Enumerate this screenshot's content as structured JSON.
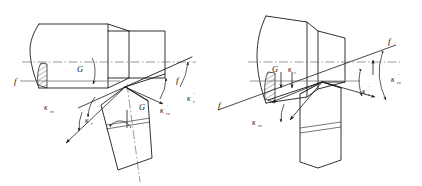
{
  "figure": {
    "background_color": "#ffffff",
    "line_color": "#1a1a1a",
    "centerline_color": "#555555",
    "width": 422,
    "height": 186
  },
  "left_diagram": {
    "name": "offset-turning-tool-configuration",
    "workpiece": "stepped cylindrical shaft with section hatching",
    "tool": "inclined single-point turning tool with chip breaker",
    "labels": {
      "feed_left": "f",
      "feed_right": "f",
      "rotation_workpiece": "G",
      "rotation_tool": "G",
      "kappa_r_eps": "κ",
      "kappa_r_eps_sub": "rε",
      "kappa_r": "κ",
      "kappa_r_sub": "r",
      "kappa_r_prime": "κ",
      "kappa_r_prime_sub": "r",
      "kappa_r_prime_mark": "′",
      "kappa_r_eps_prime": "κ",
      "kappa_r_eps_prime_sub": "rε",
      "kappa_r_eps_prime_mark": "′"
    }
  },
  "right_diagram": {
    "name": "vertical-turning-tool-configuration",
    "workpiece": "tapered conical shaft with section hatching",
    "tool": "vertical single-point turning tool with chip breaker",
    "labels": {
      "feed_left": "f",
      "feed_right": "f",
      "rotation_workpiece": "G",
      "kappa_r": "κ",
      "kappa_r_sub": "r",
      "kappa_r_eps": "κ",
      "kappa_r_eps_sub": "rε",
      "kappa_r_prime": "κ",
      "kappa_r_prime_sub": "r",
      "kappa_r_prime_mark": "′",
      "kappa_r_eps_prime": "κ",
      "kappa_r_eps_prime_sub": "rε",
      "kappa_r_eps_prime_mark": "′"
    }
  }
}
